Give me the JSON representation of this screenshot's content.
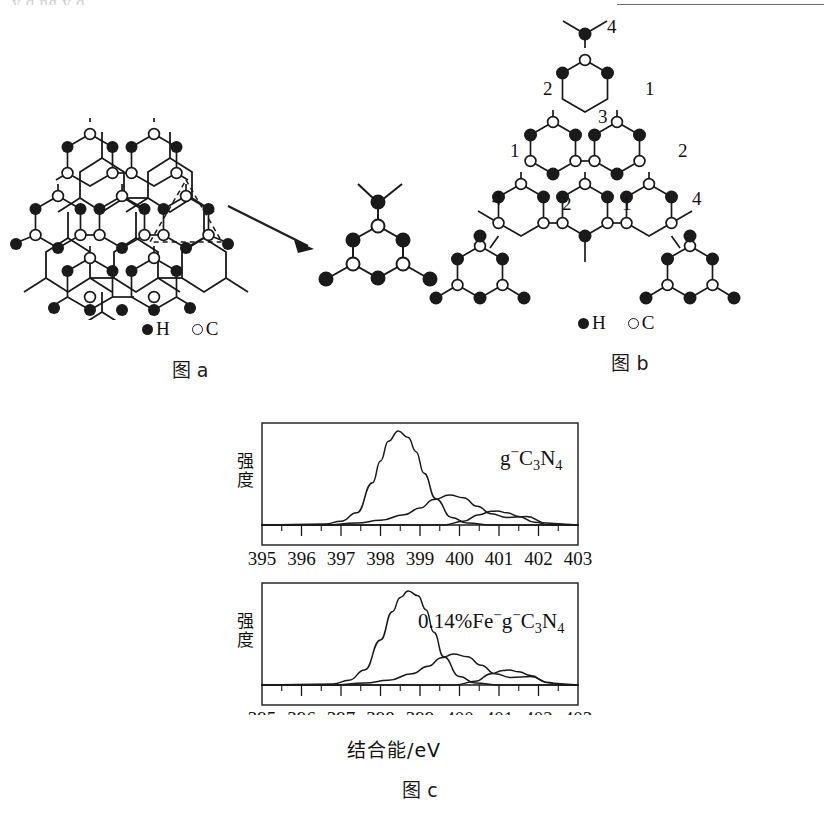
{
  "page": {
    "top_partial_text": "y q ng y q",
    "bottom_partial_text": ""
  },
  "figure_a": {
    "caption": "图 a",
    "legend": [
      {
        "marker": "filled-circle",
        "label": "H"
      },
      {
        "marker": "open-circle",
        "label": "C"
      }
    ],
    "description": "g-C3N4 triazine sheet with dashed triangular highlight and arrow to expanded unit",
    "arrow": "arrow-right-down"
  },
  "figure_b": {
    "caption": "图 b",
    "legend": [
      {
        "marker": "filled-circle",
        "label": "H"
      },
      {
        "marker": "open-circle",
        "label": "C"
      }
    ],
    "site_numbers": [
      "4",
      "2",
      "1",
      "3",
      "1",
      "2",
      "4",
      "2",
      "1",
      "4"
    ],
    "description": "g-C3N4 tri-s-triazine network with numbered nitrogen sites"
  },
  "chart_data": [
    {
      "type": "line",
      "id": "panel-top",
      "title": "",
      "series_label": "g⁻C₃N₄",
      "xlabel": "",
      "ylabel": "强度",
      "xlim": [
        395,
        403
      ],
      "ylim": [
        0,
        1
      ],
      "xticks": [
        395,
        396,
        397,
        398,
        399,
        400,
        401,
        402,
        403
      ],
      "xtick_labels": [
        "395",
        "396",
        "397",
        "398",
        "399",
        "400",
        "401",
        "402",
        "403"
      ],
      "minor_ticks": true,
      "grid": false,
      "legend_position": "top-right-inside",
      "series": [
        {
          "name": "N1 peak",
          "peak_x": 398.45,
          "peak_y": 1.0,
          "width": 0.45,
          "points_x": [
            396.6,
            397.0,
            397.4,
            397.8,
            398.0,
            398.2,
            398.45,
            398.7,
            398.9,
            399.1,
            399.4,
            399.8,
            400.2,
            400.8,
            401.6
          ],
          "points_y": [
            0.01,
            0.04,
            0.13,
            0.45,
            0.68,
            0.89,
            1.0,
            0.93,
            0.78,
            0.55,
            0.28,
            0.08,
            0.02,
            0.0,
            0.0
          ]
        },
        {
          "name": "N2 peak",
          "peak_x": 399.75,
          "peak_y": 0.32,
          "width": 0.5,
          "points_x": [
            396.6,
            397.4,
            398.0,
            398.6,
            399.0,
            399.35,
            399.75,
            400.1,
            400.45,
            400.8,
            401.2,
            401.7,
            402.2
          ],
          "points_y": [
            0.0,
            0.02,
            0.05,
            0.11,
            0.18,
            0.27,
            0.32,
            0.29,
            0.2,
            0.12,
            0.08,
            0.09,
            0.02
          ]
        },
        {
          "name": "N3 peak",
          "peak_x": 400.95,
          "peak_y": 0.15,
          "width": 0.42,
          "points_x": [
            399.6,
            400.1,
            400.5,
            400.8,
            400.95,
            401.2,
            401.5,
            401.9,
            402.3
          ],
          "points_y": [
            0.0,
            0.04,
            0.11,
            0.145,
            0.15,
            0.13,
            0.09,
            0.03,
            0.0
          ]
        }
      ]
    },
    {
      "type": "line",
      "id": "panel-bottom",
      "title": "",
      "series_label": "0.14%Fe⁻g⁻C₃N₄",
      "xlabel": "结合能/eV",
      "ylabel": "强度",
      "xlim": [
        395,
        403
      ],
      "ylim": [
        0,
        1
      ],
      "xticks": [
        395,
        396,
        397,
        398,
        399,
        400,
        401,
        402,
        403
      ],
      "xtick_labels": [
        "395",
        "396",
        "397",
        "398",
        "399",
        "400",
        "401",
        "402",
        "403"
      ],
      "minor_ticks": true,
      "grid": false,
      "legend_position": "top-right-inside",
      "series": [
        {
          "name": "N1 peak",
          "peak_x": 398.7,
          "peak_y": 1.0,
          "width": 0.45,
          "points_x": [
            396.8,
            397.2,
            397.6,
            398.0,
            398.3,
            398.5,
            398.7,
            398.95,
            399.15,
            399.35,
            399.6,
            400.0,
            400.4,
            401.0,
            401.8
          ],
          "points_y": [
            0.01,
            0.05,
            0.16,
            0.48,
            0.78,
            0.93,
            1.0,
            0.95,
            0.8,
            0.56,
            0.3,
            0.09,
            0.02,
            0.0,
            0.0
          ]
        },
        {
          "name": "N2 peak",
          "peak_x": 399.85,
          "peak_y": 0.33,
          "width": 0.5,
          "points_x": [
            396.8,
            397.6,
            398.2,
            398.8,
            399.2,
            399.55,
            399.85,
            400.2,
            400.55,
            400.9,
            401.3,
            401.8,
            402.3
          ],
          "points_y": [
            0.0,
            0.02,
            0.05,
            0.12,
            0.2,
            0.29,
            0.33,
            0.3,
            0.21,
            0.12,
            0.08,
            0.09,
            0.02
          ]
        },
        {
          "name": "N3 peak",
          "peak_x": 401.25,
          "peak_y": 0.16,
          "width": 0.42,
          "points_x": [
            399.9,
            400.4,
            400.8,
            401.1,
            401.25,
            401.5,
            401.8,
            402.2,
            402.6
          ],
          "points_y": [
            0.0,
            0.04,
            0.12,
            0.155,
            0.16,
            0.14,
            0.1,
            0.03,
            0.0
          ]
        }
      ]
    }
  ],
  "figure_c": {
    "caption": "图 c",
    "xlabel": "结合能/eV",
    "ylabel": "强度",
    "panel_labels": [
      "g⁻C₃N₄",
      "0.14%Fe⁻g⁻C₃N₄"
    ],
    "tick_labels": [
      "395",
      "396",
      "397",
      "398",
      "399",
      "400",
      "401",
      "402",
      "403"
    ]
  }
}
